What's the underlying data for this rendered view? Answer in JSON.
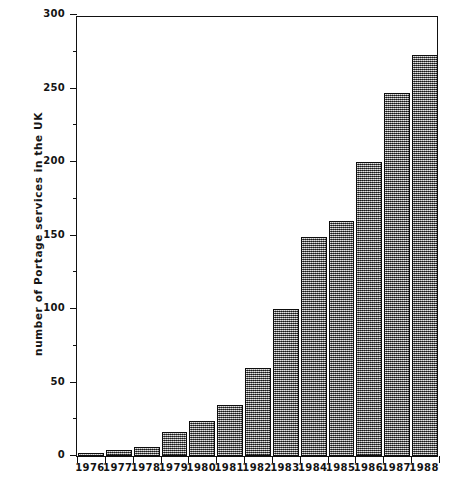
{
  "chart_data": {
    "type": "bar",
    "title": "",
    "xlabel": "",
    "ylabel": "number of Portage services in the UK",
    "categories": [
      "1976",
      "1977",
      "1978",
      "1979",
      "1980",
      "1981",
      "1982",
      "1983",
      "1984",
      "1985",
      "1986",
      "1987",
      "1988"
    ],
    "values": [
      2,
      4,
      6,
      16,
      24,
      35,
      60,
      100,
      149,
      160,
      200,
      247,
      273
    ],
    "ylim": [
      0,
      300
    ],
    "ytick_major": [
      0,
      50,
      100,
      150,
      200,
      250,
      300
    ],
    "ytick_minor": [
      25,
      75,
      125,
      175,
      225,
      275
    ],
    "ytick_labels": [
      "0",
      "50",
      "100",
      "150",
      "200",
      "250",
      "300"
    ],
    "grid": false,
    "legend": null,
    "bar_fill": "#8a8a8a",
    "bar_edge": "#0d0d0d",
    "axis_color": "#111111",
    "background": "#ffffff"
  },
  "caption": {
    "text": ""
  }
}
